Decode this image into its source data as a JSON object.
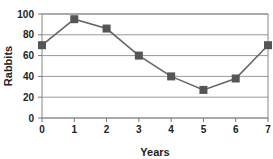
{
  "chart_data": {
    "type": "line",
    "title": "",
    "xlabel": "Years",
    "ylabel": "Rabbits",
    "x": [
      0,
      1,
      2,
      3,
      4,
      5,
      6,
      7
    ],
    "series": [
      {
        "name": "Rabbits",
        "values": [
          70,
          95,
          86,
          60,
          40,
          27,
          38,
          70
        ]
      }
    ],
    "xticks": [
      "0",
      "1",
      "2",
      "3",
      "4",
      "5",
      "6",
      "7"
    ],
    "yticks": [
      "0",
      "20",
      "40",
      "60",
      "80",
      "100"
    ],
    "xlim": [
      0,
      7
    ],
    "ylim": [
      0,
      100
    ],
    "grid": true,
    "legend": "none",
    "marker": "square",
    "line_color": "#666666",
    "marker_color": "#555555"
  }
}
